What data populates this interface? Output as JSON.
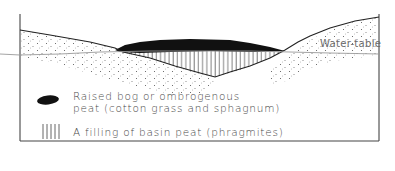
{
  "diagram": {
    "labels": {
      "water_table": "Water-table"
    },
    "legend": [
      {
        "symbol": "black-blob",
        "line1": "Raised bog or ombrogenous",
        "line2": "peat (cotton grass and sphagnum)"
      },
      {
        "symbol": "vertical-hatching",
        "line1": "A filling of basin peat (phragmites)"
      }
    ],
    "colors": {
      "ink": "#1a1a1a",
      "line": "#333333",
      "water_table": "#9a9a9a",
      "hatch": "#555555",
      "text": "#4a4a4a"
    }
  }
}
